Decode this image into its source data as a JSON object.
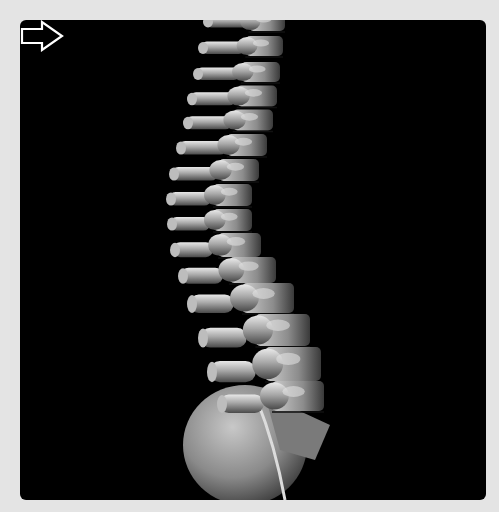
{
  "figure": {
    "background_color": "#e4e4e4",
    "panel_color": "#000000",
    "arrow": {
      "color": "#ffffff",
      "direction": "right",
      "x": 147,
      "y": 264
    }
  },
  "spine": {
    "vertebrae": [
      {
        "cx": 255,
        "cy": 2,
        "w": 54,
        "h": 16,
        "pw": 40,
        "py": -2
      },
      {
        "cx": 257,
        "cy": 22,
        "w": 56,
        "h": 18,
        "pw": 42,
        "py": 0
      },
      {
        "cx": 254,
        "cy": 46,
        "w": 58,
        "h": 20,
        "pw": 44,
        "py": 2
      },
      {
        "cx": 250,
        "cy": 72,
        "w": 60,
        "h": 20,
        "pw": 44,
        "py": 2
      },
      {
        "cx": 246,
        "cy": 96,
        "w": 62,
        "h": 21,
        "pw": 46,
        "py": 3
      },
      {
        "cx": 242,
        "cy": 120,
        "w": 62,
        "h": 21,
        "pw": 46,
        "py": 3
      },
      {
        "cx": 236,
        "cy": 145,
        "w": 62,
        "h": 22,
        "pw": 48,
        "py": 3
      },
      {
        "cx": 228,
        "cy": 170,
        "w": 62,
        "h": 22,
        "pw": 46,
        "py": 4
      },
      {
        "cx": 222,
        "cy": 195,
        "w": 60,
        "h": 22,
        "pw": 42,
        "py": 4
      },
      {
        "cx": 222,
        "cy": 220,
        "w": 60,
        "h": 22,
        "pw": 40,
        "py": 4
      },
      {
        "cx": 228,
        "cy": 245,
        "w": 66,
        "h": 24,
        "pw": 40,
        "py": 5
      },
      {
        "cx": 240,
        "cy": 270,
        "w": 72,
        "h": 26,
        "pw": 42,
        "py": 6
      },
      {
        "cx": 254,
        "cy": 298,
        "w": 80,
        "h": 30,
        "pw": 44,
        "py": 6
      },
      {
        "cx": 268,
        "cy": 330,
        "w": 84,
        "h": 32,
        "pw": 46,
        "py": 8
      },
      {
        "cx": 278,
        "cy": 364,
        "w": 86,
        "h": 34,
        "pw": 46,
        "py": 8
      },
      {
        "cx": 284,
        "cy": 396,
        "w": 80,
        "h": 30,
        "pw": 44,
        "py": 8
      }
    ],
    "sacrum": {
      "cx": 245,
      "cy": 445,
      "rx": 62,
      "ry": 60
    }
  }
}
